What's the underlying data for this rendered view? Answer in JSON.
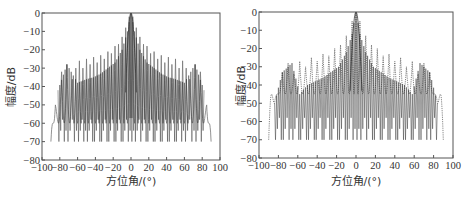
{
  "chart_data": [
    {
      "type": "line",
      "title": "",
      "xlabel": "方位角/(°)",
      "ylabel": "幅度/dB",
      "xlim": [
        -100,
        100
      ],
      "ylim": [
        -80,
        0
      ],
      "xticks": [
        -100,
        -80,
        -60,
        -40,
        -20,
        0,
        20,
        40,
        60,
        80,
        100
      ],
      "yticks": [
        0,
        -10,
        -20,
        -30,
        -40,
        -50,
        -60,
        -70,
        -80
      ],
      "grid": false,
      "legend": null,
      "series": [
        {
          "name": "envelope pattern (light line)",
          "style": "solid thin light",
          "x": [
            -90,
            -85,
            -78,
            -72,
            -66,
            -62,
            -58,
            -54,
            -50,
            -46,
            -42,
            -38,
            -34,
            -30,
            -26,
            -22,
            -18,
            -14,
            -10,
            -6,
            -2,
            0,
            2,
            6,
            10,
            14,
            18,
            22,
            26,
            30,
            34,
            38,
            42,
            46,
            50,
            54,
            58,
            62,
            66,
            72,
            78,
            85,
            90
          ],
          "y": [
            -70,
            -50,
            -32,
            -28,
            -36,
            -30,
            -26,
            -30,
            -25,
            -28,
            -24,
            -27,
            -23,
            -25,
            -21,
            -22,
            -18,
            -17,
            -13,
            -8,
            -2,
            0,
            -2,
            -8,
            -13,
            -17,
            -18,
            -22,
            -21,
            -25,
            -23,
            -27,
            -24,
            -28,
            -25,
            -30,
            -26,
            -30,
            -36,
            -28,
            -32,
            -50,
            -70
          ]
        },
        {
          "name": "array pattern (dark line)",
          "style": "solid dark, deep nulls",
          "peaks_x": [
            -82,
            -72,
            -60,
            -50,
            -42,
            -34,
            -26,
            -18,
            -10,
            -4,
            0,
            4,
            10,
            18,
            26,
            34,
            42,
            50,
            60,
            72,
            82
          ],
          "peaks_y": [
            -42,
            -28,
            -38,
            -36,
            -35,
            -33,
            -30,
            -27,
            -20,
            -10,
            0,
            -10,
            -20,
            -27,
            -30,
            -33,
            -35,
            -36,
            -38,
            -28,
            -42
          ],
          "null_depth_dB": -70
        }
      ]
    },
    {
      "type": "line",
      "title": "",
      "xlabel": "方位角/(°)",
      "ylabel": "幅度/dB",
      "xlim": [
        -100,
        100
      ],
      "ylim": [
        -80,
        0
      ],
      "xticks": [
        -100,
        -80,
        -60,
        -40,
        -20,
        0,
        20,
        40,
        60,
        80,
        100
      ],
      "yticks": [
        0,
        -10,
        -20,
        -30,
        -40,
        -50,
        -60,
        -70,
        -80
      ],
      "grid": false,
      "legend": null,
      "series": [
        {
          "name": "envelope pattern (dotted line)",
          "style": "dotted",
          "x": [
            -90,
            -84,
            -76,
            -70,
            -64,
            -58,
            -52,
            -46,
            -40,
            -34,
            -28,
            -22,
            -16,
            -10,
            -4,
            0,
            4,
            10,
            16,
            22,
            28,
            34,
            40,
            46,
            52,
            58,
            64,
            70,
            76,
            84,
            90
          ],
          "y": [
            -70,
            -50,
            -33,
            -28,
            -34,
            -27,
            -30,
            -25,
            -27,
            -23,
            -24,
            -20,
            -18,
            -13,
            -5,
            0,
            -5,
            -13,
            -18,
            -20,
            -24,
            -23,
            -27,
            -25,
            -30,
            -27,
            -34,
            -28,
            -33,
            -50,
            -70
          ],
          "notes": "dense dotted side lobes with -40 to -45 dB floor"
        },
        {
          "name": "array pattern (dark line)",
          "style": "solid dark, deep nulls",
          "peaks_x": [
            -84,
            -76,
            -66,
            -58,
            -50,
            -42,
            -34,
            -26,
            -18,
            -10,
            -4,
            0,
            4,
            10,
            18,
            26,
            34,
            42,
            50,
            58,
            66,
            76,
            84
          ],
          "peaks_y": [
            -50,
            -33,
            -28,
            -45,
            -40,
            -38,
            -36,
            -33,
            -30,
            -22,
            -12,
            0,
            -12,
            -22,
            -30,
            -33,
            -36,
            -38,
            -40,
            -45,
            -28,
            -33,
            -50
          ],
          "null_depth_dB": -70
        }
      ]
    }
  ],
  "left": {
    "ylabel": "幅度/dB",
    "xlabel": "方位角/(°)",
    "yticks": [
      "0",
      "−10",
      "−20",
      "−30",
      "−40",
      "−50",
      "−60",
      "−70",
      "−80"
    ],
    "xticks": [
      "−100",
      "−80",
      "−60",
      "−40",
      "−20",
      "0",
      "20",
      "40",
      "60",
      "80",
      "100"
    ]
  },
  "right": {
    "ylabel": "幅度/dB",
    "xlabel": "方位角/(°)",
    "yticks": [
      "0",
      "−10",
      "−20",
      "−30",
      "−40",
      "−50",
      "−60",
      "−70",
      "−80"
    ],
    "xticks": [
      "−100",
      "−80",
      "−60",
      "−40",
      "−20",
      "0",
      "20",
      "40",
      "60",
      "80",
      "100"
    ]
  }
}
